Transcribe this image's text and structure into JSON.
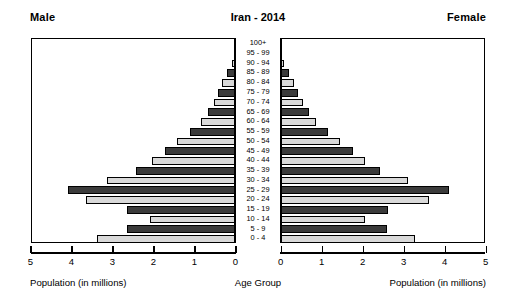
{
  "header": {
    "male_label": "Male",
    "female_label": "Female",
    "title": "Iran - 2014"
  },
  "captions": {
    "left_axis": "Population (in millions)",
    "center_axis": "Age Group",
    "right_axis": "Population (in millions)"
  },
  "axis_ticks": {
    "left": [
      "5",
      "4",
      "3",
      "2",
      "1",
      "0"
    ],
    "right": [
      "0",
      "1",
      "2",
      "3",
      "4",
      "5"
    ]
  },
  "colors": {
    "bar_dark": "#3b3b3b",
    "bar_light": "#d9d9d9",
    "outline": "#000000",
    "background": "#ffffff"
  },
  "chart_data": {
    "type": "bar",
    "title": "Iran - 2014",
    "subtitle": "",
    "orientation": "horizontal-diverging",
    "xlabel": "Population (in millions)",
    "ylabel": "Age Group",
    "xlim": [
      0,
      5
    ],
    "grid": false,
    "legend_position": "none",
    "categories": [
      "100+",
      "95 - 99",
      "90 - 94",
      "85 - 89",
      "80 - 84",
      "75 - 79",
      "70 - 74",
      "65 - 69",
      "60 - 64",
      "55 - 59",
      "50 - 54",
      "45 - 49",
      "40 - 44",
      "35 - 39",
      "30 - 34",
      "25 - 29",
      "20 - 24",
      "15 - 19",
      "10 - 14",
      "5 - 9",
      "0 - 4"
    ],
    "series": [
      {
        "name": "Male",
        "side": "left",
        "values": [
          0.01,
          0.04,
          0.09,
          0.21,
          0.33,
          0.43,
          0.54,
          0.68,
          0.86,
          1.13,
          1.43,
          1.74,
          2.06,
          2.43,
          3.15,
          4.1,
          3.65,
          2.65,
          2.11,
          2.65,
          3.38
        ]
      },
      {
        "name": "Female",
        "side": "right",
        "values": [
          0.01,
          0.05,
          0.1,
          0.22,
          0.34,
          0.44,
          0.55,
          0.7,
          0.88,
          1.16,
          1.46,
          1.77,
          2.08,
          2.45,
          3.12,
          4.12,
          3.63,
          2.63,
          2.08,
          2.61,
          3.3
        ]
      }
    ]
  }
}
